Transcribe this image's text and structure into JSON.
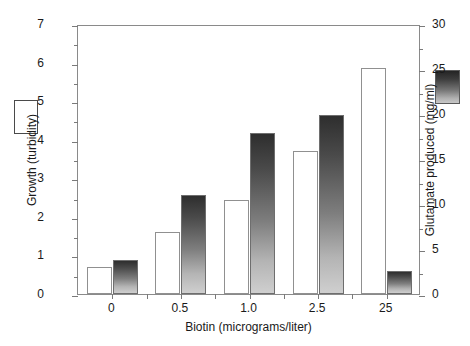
{
  "chart_data": {
    "type": "bar",
    "title": "",
    "xlabel": "Biotin (micrograms/liter)",
    "categories": [
      "0",
      "0.5",
      "1.0",
      "2.5",
      "25"
    ],
    "grid": false,
    "legend_position": "outside-left-and-right",
    "axes": {
      "left": {
        "label": "Growth (turbidity)",
        "ylim": [
          0,
          7
        ],
        "ticks": [
          0,
          1,
          2,
          3,
          4,
          5,
          6,
          7
        ],
        "tick_labels": [
          "0",
          "1",
          "2",
          "3",
          "4",
          "5",
          "6",
          "7"
        ],
        "minor_ticks": [
          0.5,
          1.5,
          2.5,
          3.5,
          4.5,
          5.5,
          6.5
        ]
      },
      "right": {
        "label": "Glutamate produced (mg/ml)",
        "ylim": [
          0,
          30
        ],
        "ticks": [
          0,
          5,
          10,
          15,
          20,
          25,
          30
        ],
        "tick_labels": [
          "0",
          "5",
          "10",
          "15",
          "20",
          "25",
          "30"
        ],
        "minor_ticks": [
          2.5,
          7.5,
          12.5,
          17.5,
          22.5,
          27.5
        ]
      }
    },
    "series": [
      {
        "name": "Growth (turbidity)",
        "axis": "left",
        "style": "open-white",
        "swatch": "legend-open-box",
        "values": [
          0.7,
          1.6,
          2.45,
          3.7,
          5.85
        ]
      },
      {
        "name": "Glutamate produced (mg/ml)",
        "axis": "right",
        "style": "gradient-gray",
        "swatch": "legend-gradient-box",
        "values": [
          3.8,
          11.0,
          17.9,
          19.9,
          2.6
        ]
      }
    ]
  },
  "colors": {
    "axis": "#8a8a8a",
    "tick": "#7a7a7a",
    "text": "#1a1a1a",
    "open_bar_fill": "#ffffff",
    "open_bar_stroke": "#909090",
    "gradient_bar_top": "#2e2e2e",
    "gradient_bar_bottom": "#cfcfcf",
    "background": "#ffffff"
  }
}
